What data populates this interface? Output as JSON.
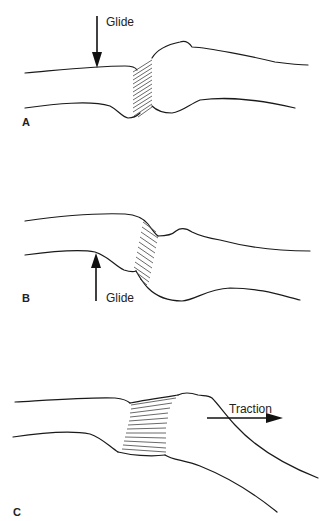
{
  "figure": {
    "panels": [
      {
        "id": "A",
        "label": "A",
        "arrow_label": "Glide",
        "arrow_direction": "down"
      },
      {
        "id": "B",
        "label": "B",
        "arrow_label": "Glide",
        "arrow_direction": "up"
      },
      {
        "id": "C",
        "label": "C",
        "arrow_label": "Traction",
        "arrow_direction": "right"
      }
    ],
    "colors": {
      "line": "#1a1a1a",
      "hatch": "#444444",
      "background": "#ffffff"
    }
  }
}
